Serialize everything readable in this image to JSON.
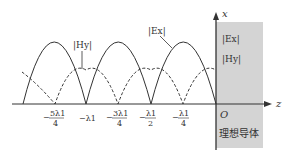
{
  "diagram": {
    "axes": {
      "vertical_axis_label": "x",
      "horizontal_axis_label": "z",
      "origin_label": "O"
    },
    "conductor": {
      "label": "理想导体",
      "fill_color": "#d4d4d4",
      "inside_labels": [
        "|Ex|",
        "|Hy|"
      ]
    },
    "curves": [
      {
        "name": "|Ex|",
        "style": "solid",
        "color": "#333333"
      },
      {
        "name": "|Hy|",
        "style": "dashed",
        "color": "#333333"
      }
    ],
    "curve_labels": {
      "E": "|Ex|",
      "H": "|Hy|"
    },
    "tick_labels": [
      {
        "num": "5λ1",
        "den": "4",
        "sign": "−",
        "z": "-5λ1/4"
      },
      {
        "text": "−λ1",
        "z": "-λ1"
      },
      {
        "num": "3λ1",
        "den": "4",
        "sign": "−",
        "z": "-3λ1/4"
      },
      {
        "num": "λ1",
        "den": "2",
        "sign": "−",
        "z": "-λ1/2"
      },
      {
        "num": "λ1",
        "den": "4",
        "sign": "−",
        "z": "-λ1/4"
      }
    ],
    "E_zeros_at": [
      "-3λ1/2",
      "-λ1",
      "-λ1/2",
      "0"
    ],
    "H_zeros_at": [
      "-5λ1/4",
      "-3λ1/4",
      "-λ1/4"
    ]
  }
}
